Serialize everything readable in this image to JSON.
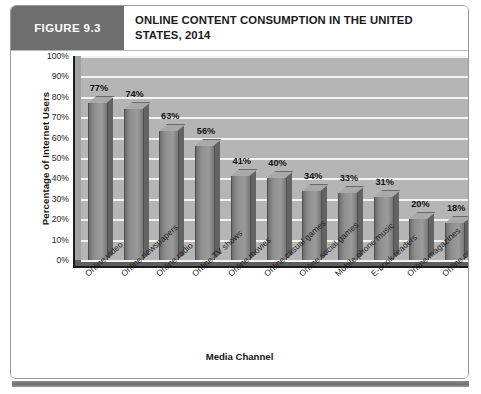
{
  "figure": {
    "number_label": "FIGURE 9.3",
    "title": "ONLINE CONTENT CONSUMPTION IN THE UNITED STATES, 2014"
  },
  "chart_data": {
    "type": "bar",
    "title": "ONLINE CONTENT CONSUMPTION IN THE UNITED STATES, 2014",
    "xlabel": "Media Channel",
    "ylabel": "Percentage of Internet Users",
    "ylim": [
      0,
      100
    ],
    "ytick_labels": [
      "100%",
      "90%",
      "80%",
      "70%",
      "60%",
      "50%",
      "40%",
      "30%",
      "20%",
      "10%",
      "0%"
    ],
    "ytick_values": [
      100,
      90,
      80,
      70,
      60,
      50,
      40,
      30,
      20,
      10,
      0
    ],
    "grid": true,
    "legend": false,
    "categories": [
      "Online video",
      "Online newspapers",
      "Online radio",
      "Online TV shows",
      "Online movies",
      "Online casual games",
      "Online social games",
      "Mobile phone music",
      "E-book readers",
      "Online magazines",
      "Online console games"
    ],
    "values": [
      77,
      74,
      63,
      56,
      41,
      40,
      34,
      33,
      31,
      20,
      18
    ],
    "value_labels": [
      "77%",
      "74%",
      "63%",
      "56%",
      "41%",
      "40%",
      "34%",
      "33%",
      "31%",
      "20%",
      "18%"
    ],
    "colors": {
      "bar_face": "#8e8e8e",
      "bar_side": "#636363",
      "bar_top": "#a9a9a9",
      "plot_background": "#b5b5b5",
      "gridline": "#f2f2f2",
      "axis": "#1c1c1c",
      "header_block": "#6e6e6e"
    }
  }
}
